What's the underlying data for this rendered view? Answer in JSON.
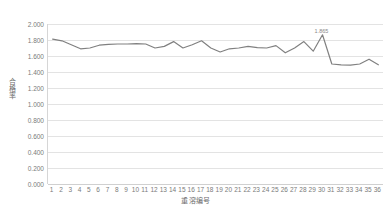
{
  "chart_data": {
    "type": "line",
    "title": "",
    "xlabel": "重溶编号",
    "ylabel": "合格率",
    "ylim": [
      0.0,
      2.0
    ],
    "ytick_step": 0.2,
    "ytick_labels": [
      "0.000",
      "0.200",
      "0.400",
      "0.600",
      "0.800",
      "1.000",
      "1.200",
      "1.400",
      "1.600",
      "1.800",
      "2.000"
    ],
    "ytick_values": [
      0.0,
      0.2,
      0.4,
      0.6,
      0.8,
      1.0,
      1.2,
      1.4,
      1.6,
      1.8,
      2.0
    ],
    "grid": true,
    "legend": "none",
    "line_color": "#808080",
    "gridline_color": "#e3e3e3",
    "axis_color": "#d0d0d0",
    "categories": [
      "1",
      "2",
      "3",
      "4",
      "5",
      "6",
      "7",
      "8",
      "9",
      "10",
      "11",
      "12",
      "13",
      "14",
      "15",
      "16",
      "17",
      "18",
      "19",
      "20",
      "21",
      "22",
      "23",
      "24",
      "25",
      "26",
      "27",
      "28",
      "29",
      "30",
      "31",
      "32",
      "33",
      "34",
      "35",
      "36"
    ],
    "x": [
      1,
      2,
      3,
      4,
      5,
      6,
      7,
      8,
      9,
      10,
      11,
      12,
      13,
      14,
      15,
      16,
      17,
      18,
      19,
      20,
      21,
      22,
      23,
      24,
      25,
      26,
      27,
      28,
      29,
      30,
      31,
      32,
      33,
      34,
      35,
      36
    ],
    "values": [
      1.81,
      1.79,
      1.74,
      1.69,
      1.7,
      1.735,
      1.745,
      1.75,
      1.75,
      1.755,
      1.75,
      1.7,
      1.72,
      1.78,
      1.7,
      1.74,
      1.79,
      1.7,
      1.65,
      1.69,
      1.7,
      1.72,
      1.705,
      1.7,
      1.73,
      1.64,
      1.7,
      1.78,
      1.66,
      1.865,
      1.5,
      1.49,
      1.485,
      1.5,
      1.56,
      1.49
    ],
    "annotations": [
      {
        "x": 30,
        "y": 1.865,
        "text": "1.865"
      }
    ],
    "series_name": "合格率"
  }
}
